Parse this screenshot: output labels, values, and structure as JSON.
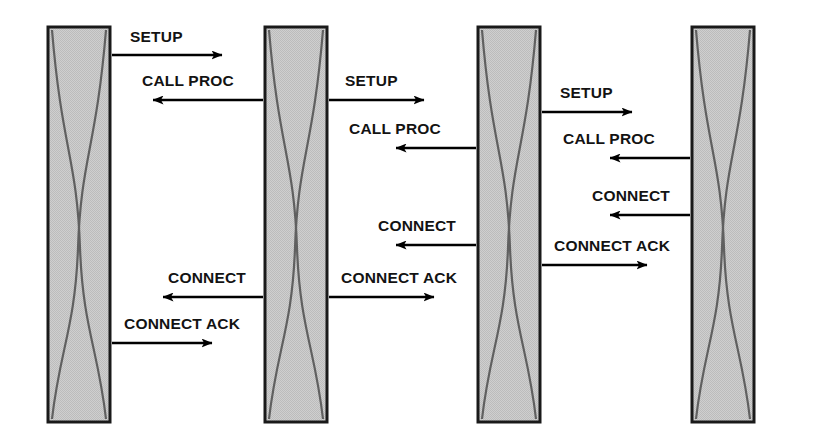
{
  "diagram": {
    "type": "sequence-diagram",
    "canvas": {
      "width": 818,
      "height": 447,
      "background": "#ffffff"
    },
    "style": {
      "node_fill": "#c9c9c9",
      "node_stroke": "#1a1a1a",
      "curve_stroke": "#606060",
      "arrow_color": "#000000",
      "label_color": "#131313"
    },
    "nodes": [
      {
        "id": "node-1",
        "name": "switch-column-1",
        "x": 48,
        "y": 27,
        "width": 62,
        "height": 395
      },
      {
        "id": "node-2",
        "name": "switch-column-2",
        "x": 265,
        "y": 27,
        "width": 62,
        "height": 395
      },
      {
        "id": "node-3",
        "name": "switch-column-3",
        "x": 478,
        "y": 27,
        "width": 62,
        "height": 395
      },
      {
        "id": "node-4",
        "name": "switch-column-4",
        "x": 692,
        "y": 27,
        "width": 62,
        "height": 395
      }
    ],
    "messages": [
      {
        "id": "m1",
        "label": "SETUP",
        "direction": "right",
        "from": "node-1",
        "to": "node-2",
        "x1": 112,
        "x2": 222,
        "y": 55,
        "label_x": 130,
        "label_y": 42
      },
      {
        "id": "m2",
        "label": "CALL PROC",
        "direction": "left",
        "from": "node-2",
        "to": "node-1",
        "x1": 263,
        "x2": 153,
        "y": 100,
        "label_x": 142,
        "label_y": 86
      },
      {
        "id": "m3",
        "label": "CONNECT",
        "direction": "left",
        "from": "node-2",
        "to": "node-1",
        "x1": 263,
        "x2": 163,
        "y": 297,
        "label_x": 168,
        "label_y": 283
      },
      {
        "id": "m4",
        "label": "CONNECT ACK",
        "direction": "right",
        "from": "node-1",
        "to": "node-2",
        "x1": 112,
        "x2": 212,
        "y": 343,
        "label_x": 124,
        "label_y": 329
      },
      {
        "id": "m5",
        "label": "SETUP",
        "direction": "right",
        "from": "node-2",
        "to": "node-3",
        "x1": 329,
        "x2": 424,
        "y": 100,
        "label_x": 345,
        "label_y": 86
      },
      {
        "id": "m6",
        "label": "CALL PROC",
        "direction": "left",
        "from": "node-3",
        "to": "node-2",
        "x1": 476,
        "x2": 396,
        "y": 148,
        "label_x": 349,
        "label_y": 134
      },
      {
        "id": "m7",
        "label": "CONNECT",
        "direction": "left",
        "from": "node-3",
        "to": "node-2",
        "x1": 476,
        "x2": 396,
        "y": 245,
        "label_x": 378,
        "label_y": 231
      },
      {
        "id": "m8",
        "label": "CONNECT ACK",
        "direction": "right",
        "from": "node-2",
        "to": "node-3",
        "x1": 329,
        "x2": 434,
        "y": 297,
        "label_x": 341,
        "label_y": 283
      },
      {
        "id": "m9",
        "label": "SETUP",
        "direction": "right",
        "from": "node-3",
        "to": "node-4",
        "x1": 542,
        "x2": 632,
        "y": 112,
        "label_x": 560,
        "label_y": 98
      },
      {
        "id": "m10",
        "label": "CALL PROC",
        "direction": "left",
        "from": "node-4",
        "to": "node-3",
        "x1": 690,
        "x2": 610,
        "y": 158,
        "label_x": 563,
        "label_y": 144
      },
      {
        "id": "m11",
        "label": "CONNECT",
        "direction": "left",
        "from": "node-4",
        "to": "node-3",
        "x1": 690,
        "x2": 610,
        "y": 215,
        "label_x": 592,
        "label_y": 201
      },
      {
        "id": "m12",
        "label": "CONNECT ACK",
        "direction": "right",
        "from": "node-3",
        "to": "node-4",
        "x1": 542,
        "x2": 647,
        "y": 265,
        "label_x": 554,
        "label_y": 251
      }
    ]
  }
}
